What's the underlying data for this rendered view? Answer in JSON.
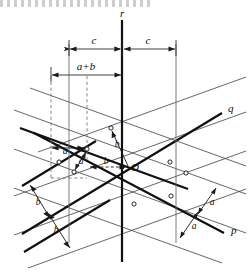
{
  "figure": {
    "kind": "crystal-lattice-projection-diagram",
    "background_color": "#ffffff",
    "line_color": "#111111",
    "thin_line_color": "#3a3a3a",
    "dashed_line_color": "#6d6d6d",
    "dimension_line_color": "#2a2a2a"
  },
  "axes": [
    {
      "id": "axis-p",
      "label": "p",
      "x": 229,
      "y": 232,
      "direction": "lower-right"
    },
    {
      "id": "axis-q",
      "label": "q",
      "x": 228,
      "y": 111,
      "direction": "upper-right"
    },
    {
      "id": "axis-r",
      "label": "r",
      "x": 123,
      "y": 14,
      "direction": "vertical-up"
    }
  ],
  "origin": {
    "id": "origin-O",
    "label": "O",
    "x": 130,
    "y": 168
  },
  "dimensions": [
    {
      "id": "dim-c-left",
      "label": "c",
      "x": 94,
      "y": 43,
      "x1": 69,
      "x2": 122,
      "y_line": 49
    },
    {
      "id": "dim-c-right",
      "label": "c",
      "x": 148,
      "y": 43,
      "x1": 123,
      "x2": 176,
      "y_line": 49
    },
    {
      "id": "dim-ab",
      "label": "a+b",
      "x": 86,
      "y": 69,
      "x1": 51,
      "x2": 122,
      "y_line": 75
    }
  ],
  "measure_labels": [
    {
      "id": "label-a-top-left",
      "label": "a",
      "x": 65,
      "y": 153
    },
    {
      "id": "label-a-inner-left",
      "label": "a",
      "x": 80,
      "y": 163
    },
    {
      "id": "label-b-upper-center",
      "label": "b",
      "x": 115,
      "y": 143
    },
    {
      "id": "label-b-left-of-O",
      "label": "b",
      "x": 103,
      "y": 165
    },
    {
      "id": "label-b-lower-left-1",
      "label": "b",
      "x": 39,
      "y": 202
    },
    {
      "id": "label-b-lower-left-2",
      "label": "b",
      "x": 57,
      "y": 230
    },
    {
      "id": "label-a-lower-right-1",
      "label": "a",
      "x": 212,
      "y": 203
    },
    {
      "id": "label-a-lower-right-2",
      "label": "a",
      "x": 194,
      "y": 227
    }
  ],
  "lattice_nodes": [
    {
      "x": 111,
      "y": 128
    },
    {
      "x": 59,
      "y": 162
    },
    {
      "x": 74,
      "y": 172
    },
    {
      "x": 87,
      "y": 148
    },
    {
      "x": 170,
      "y": 162
    },
    {
      "x": 186,
      "y": 173
    },
    {
      "x": 171,
      "y": 195
    },
    {
      "x": 134,
      "y": 203
    }
  ]
}
